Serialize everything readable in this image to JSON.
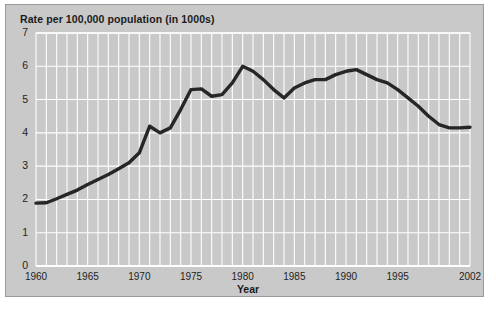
{
  "figure": {
    "title": "Rate per 100,000 population (in 1000s)",
    "panel_color": "#c9c9c9",
    "gridline_color": "#ffffff",
    "line_color": "#262626",
    "border_color": "#9a9a9a"
  },
  "chart_data": {
    "type": "line",
    "title": "Rate per 100,000 population (in 1000s)",
    "xlabel": "Year",
    "ylabel": "",
    "xlim": [
      1960,
      2002
    ],
    "ylim": [
      0,
      7
    ],
    "grid": true,
    "legend": "none",
    "xticks": [
      1960,
      1965,
      1970,
      1975,
      1980,
      1985,
      1990,
      1995,
      2002
    ],
    "xtick_labels": [
      "1960",
      "1965",
      "1970",
      "1975",
      "1980",
      "1985",
      "1990",
      "1995",
      "2002"
    ],
    "yticks": [
      0,
      1,
      2,
      3,
      4,
      5,
      6,
      7
    ],
    "ytick_labels": [
      "0",
      "1",
      "2",
      "3",
      "4",
      "5",
      "6",
      "7"
    ],
    "x": [
      1960,
      1961,
      1962,
      1963,
      1964,
      1965,
      1966,
      1967,
      1968,
      1969,
      1970,
      1971,
      1972,
      1973,
      1974,
      1975,
      1976,
      1977,
      1978,
      1979,
      1980,
      1981,
      1982,
      1983,
      1984,
      1985,
      1986,
      1987,
      1988,
      1989,
      1990,
      1991,
      1992,
      1993,
      1994,
      1995,
      1996,
      1997,
      1998,
      1999,
      2000,
      2001,
      2002
    ],
    "values": [
      1.89,
      1.9,
      2.02,
      2.15,
      2.28,
      2.45,
      2.6,
      2.75,
      2.92,
      3.1,
      3.4,
      4.2,
      4.0,
      4.15,
      4.7,
      5.3,
      5.32,
      5.1,
      5.15,
      5.5,
      6.0,
      5.85,
      5.6,
      5.3,
      5.05,
      5.35,
      5.5,
      5.6,
      5.6,
      5.75,
      5.85,
      5.9,
      5.75,
      5.6,
      5.5,
      5.3,
      5.05,
      4.8,
      4.5,
      4.25,
      4.15,
      4.15,
      4.17
    ],
    "series": [
      {
        "name": "Rate per 100,000 population (in 1000s)",
        "values": [
          1.89,
          1.9,
          2.02,
          2.15,
          2.28,
          2.45,
          2.6,
          2.75,
          2.92,
          3.1,
          3.4,
          4.2,
          4.0,
          4.15,
          4.7,
          5.3,
          5.32,
          5.1,
          5.15,
          5.5,
          6.0,
          5.85,
          5.6,
          5.3,
          5.05,
          5.35,
          5.5,
          5.6,
          5.6,
          5.75,
          5.85,
          5.9,
          5.75,
          5.6,
          5.5,
          5.3,
          5.05,
          4.8,
          4.5,
          4.25,
          4.15,
          4.15,
          4.17
        ]
      }
    ]
  }
}
